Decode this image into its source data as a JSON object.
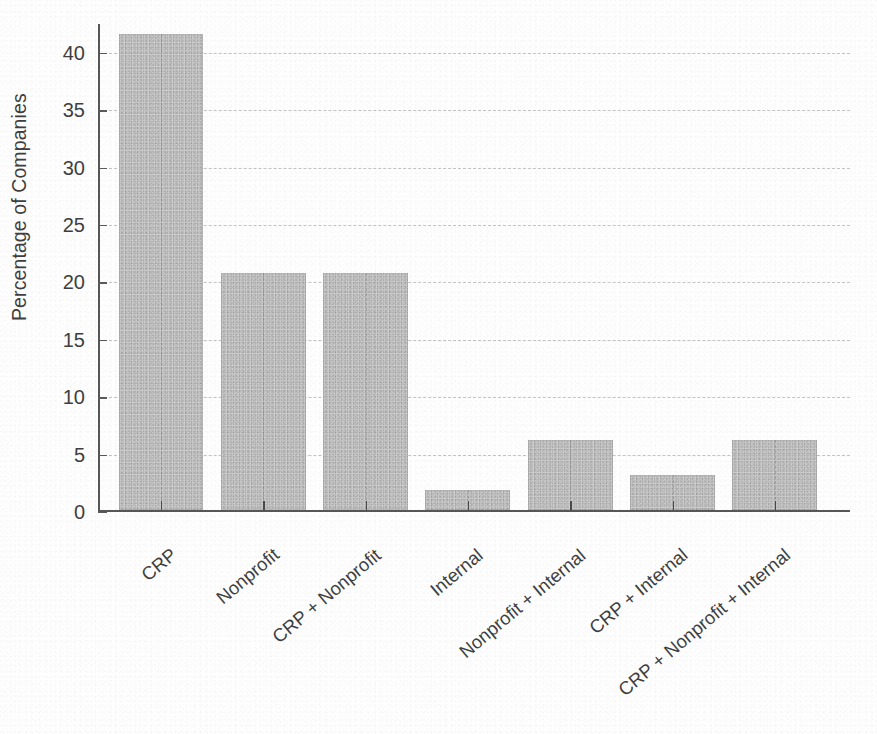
{
  "chart_data": {
    "type": "bar",
    "title": "",
    "subtitle": "",
    "xlabel": "",
    "ylabel": "Percentage of Companies",
    "categories": [
      "CRP",
      "Nonprofit",
      "CRP + Nonprofit",
      "Internal",
      "Nonprofit + Internal",
      "CRP + Internal",
      "CRP + Nonprofit + Internal"
    ],
    "values": [
      41.5,
      20.7,
      20.7,
      1.8,
      6.1,
      3.1,
      6.1
    ],
    "ylim": [
      0,
      42.5
    ],
    "yticks": [
      0,
      5,
      10,
      15,
      20,
      25,
      30,
      35,
      40
    ],
    "ytick_labels": [
      "0",
      "5",
      "10",
      "15",
      "20",
      "25",
      "30",
      "35",
      "40"
    ],
    "grid": true,
    "grid_style": "dashed",
    "grid_axis": "both",
    "legend": "none",
    "bar_color": "#cfcfcf",
    "axis_color": "#575757",
    "text_color": "#3f3f3f",
    "xtick_label_rotation": -40
  }
}
